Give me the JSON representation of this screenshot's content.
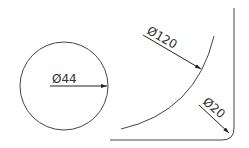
{
  "diagram": {
    "stroke_color": "#333333",
    "background": "#ffffff",
    "dimensions": [
      {
        "id": "circle",
        "label": "Ø44",
        "type": "diameter"
      },
      {
        "id": "large-arc",
        "label": "Ø120",
        "type": "diameter"
      },
      {
        "id": "corner-fillet",
        "label": "Ø20",
        "type": "diameter"
      }
    ]
  }
}
